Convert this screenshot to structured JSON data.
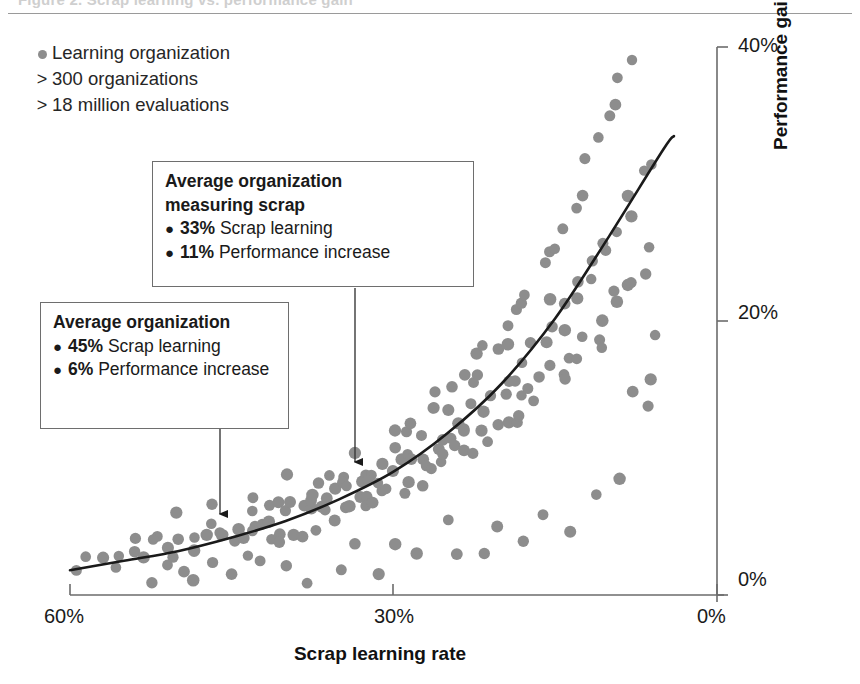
{
  "figure": {
    "clipped_header": "Figure 2. Scrap learning vs. performance gain",
    "legend": {
      "series_label": "Learning organization",
      "stat_lines": [
        {
          "prefix": ">",
          "text": "300 organizations"
        },
        {
          "prefix": ">",
          "text": "18 million evaluations"
        }
      ],
      "marker_color": "#8d8d8d"
    },
    "callouts": [
      {
        "id": "callout-measuring",
        "title": "Average organization\nmeasuring scrap",
        "items": [
          {
            "value": "33%",
            "text": " Scrap learning"
          },
          {
            "value": "11%",
            "text": " Performance increase"
          }
        ]
      },
      {
        "id": "callout-average",
        "title": "Average organization",
        "items": [
          {
            "value": "45%",
            "text": " Scrap learning"
          },
          {
            "value": "6%",
            "text": " Performance increase"
          }
        ]
      }
    ]
  },
  "chart_data": {
    "type": "scatter",
    "title": "",
    "xlabel": "Scrap learning rate",
    "ylabel": "Performance gain due to learning",
    "xlim": [
      60,
      0
    ],
    "ylim": [
      0,
      40
    ],
    "x_axis_reversed": true,
    "grid": false,
    "legend_position": "top-left",
    "x_ticks": [
      "60%",
      "30%",
      "0%"
    ],
    "x_tick_values": [
      60,
      30,
      0
    ],
    "y_ticks": [
      "0%",
      "20%",
      "40%"
    ],
    "y_tick_values": [
      0,
      20,
      40
    ],
    "point_color": "#8d8d8d",
    "trend_color": "#1a1a1a",
    "trend_label": "Fitted exponential trend",
    "annotations": [
      {
        "label": "Average organization",
        "x": 45,
        "y": 6
      },
      {
        "label": "Average organization measuring scrap",
        "x": 33,
        "y": 11
      }
    ],
    "series": [
      {
        "name": "Learning organization",
        "points": [
          [
            59.4,
            1.6
          ],
          [
            58.0,
            2.0
          ],
          [
            57.2,
            2.3
          ],
          [
            56.1,
            2.0
          ],
          [
            55.0,
            3.1
          ],
          [
            54.4,
            2.6
          ],
          [
            53.6,
            3.4
          ],
          [
            52.8,
            2.9
          ],
          [
            52.0,
            3.6
          ],
          [
            51.3,
            2.2
          ],
          [
            50.7,
            3.9
          ],
          [
            50.0,
            3.2
          ],
          [
            49.4,
            4.4
          ],
          [
            48.8,
            2.8
          ],
          [
            48.1,
            3.6
          ],
          [
            47.5,
            4.1
          ],
          [
            47.0,
            3.0
          ],
          [
            46.4,
            4.6
          ],
          [
            45.9,
            3.7
          ],
          [
            45.3,
            5.0
          ],
          [
            44.8,
            4.2
          ],
          [
            44.3,
            3.4
          ],
          [
            43.9,
            5.2
          ],
          [
            43.4,
            4.5
          ],
          [
            43.0,
            3.9
          ],
          [
            42.6,
            5.6
          ],
          [
            42.1,
            4.8
          ],
          [
            41.7,
            4.1
          ],
          [
            41.3,
            6.0
          ],
          [
            40.9,
            5.1
          ],
          [
            40.5,
            4.4
          ],
          [
            40.1,
            6.3
          ],
          [
            39.7,
            5.5
          ],
          [
            39.4,
            4.7
          ],
          [
            39.0,
            6.6
          ],
          [
            38.7,
            5.8
          ],
          [
            38.3,
            5.0
          ],
          [
            38.0,
            7.0
          ],
          [
            37.6,
            6.1
          ],
          [
            37.3,
            5.3
          ],
          [
            37.0,
            7.4
          ],
          [
            36.7,
            6.4
          ],
          [
            36.3,
            5.6
          ],
          [
            36.0,
            7.8
          ],
          [
            35.7,
            6.8
          ],
          [
            35.4,
            5.9
          ],
          [
            35.1,
            8.2
          ],
          [
            34.8,
            7.1
          ],
          [
            34.5,
            6.2
          ],
          [
            34.2,
            8.6
          ],
          [
            33.9,
            7.4
          ],
          [
            33.6,
            6.5
          ],
          [
            33.3,
            9.0
          ],
          [
            33.0,
            7.8
          ],
          [
            32.7,
            6.8
          ],
          [
            32.4,
            9.4
          ],
          [
            32.1,
            8.1
          ],
          [
            31.8,
            7.1
          ],
          [
            31.6,
            9.8
          ],
          [
            31.3,
            8.5
          ],
          [
            31.0,
            7.4
          ],
          [
            30.7,
            10.3
          ],
          [
            30.4,
            8.8
          ],
          [
            30.2,
            7.7
          ],
          [
            29.9,
            10.8
          ],
          [
            29.6,
            9.2
          ],
          [
            29.3,
            8.0
          ],
          [
            29.1,
            11.3
          ],
          [
            28.8,
            9.6
          ],
          [
            28.5,
            8.4
          ],
          [
            28.3,
            11.8
          ],
          [
            28.0,
            10.0
          ],
          [
            27.7,
            8.7
          ],
          [
            27.5,
            12.4
          ],
          [
            27.2,
            10.4
          ],
          [
            26.9,
            9.0
          ],
          [
            26.7,
            13.0
          ],
          [
            26.4,
            10.9
          ],
          [
            26.1,
            9.4
          ],
          [
            25.9,
            13.6
          ],
          [
            25.6,
            11.3
          ],
          [
            25.4,
            9.8
          ],
          [
            25.1,
            14.2
          ],
          [
            24.8,
            11.8
          ],
          [
            24.6,
            10.2
          ],
          [
            24.3,
            14.9
          ],
          [
            24.0,
            12.3
          ],
          [
            23.8,
            10.6
          ],
          [
            23.5,
            15.6
          ],
          [
            23.3,
            12.8
          ],
          [
            23.0,
            11.0
          ],
          [
            22.7,
            16.3
          ],
          [
            22.5,
            13.3
          ],
          [
            22.2,
            11.4
          ],
          [
            22.0,
            17.1
          ],
          [
            21.7,
            13.9
          ],
          [
            21.4,
            11.9
          ],
          [
            21.2,
            17.9
          ],
          [
            20.9,
            14.5
          ],
          [
            20.7,
            12.3
          ],
          [
            20.4,
            18.7
          ],
          [
            20.1,
            15.1
          ],
          [
            19.9,
            12.8
          ],
          [
            19.6,
            19.6
          ],
          [
            19.4,
            15.7
          ],
          [
            19.1,
            13.3
          ],
          [
            18.8,
            20.5
          ],
          [
            18.6,
            16.4
          ],
          [
            18.3,
            13.8
          ],
          [
            18.1,
            21.5
          ],
          [
            17.8,
            17.1
          ],
          [
            17.5,
            14.3
          ],
          [
            17.3,
            22.5
          ],
          [
            17.0,
            17.8
          ],
          [
            16.8,
            14.9
          ],
          [
            16.5,
            23.6
          ],
          [
            16.2,
            18.5
          ],
          [
            16.0,
            15.4
          ],
          [
            15.7,
            24.7
          ],
          [
            15.5,
            19.3
          ],
          [
            15.2,
            16.0
          ],
          [
            14.9,
            25.9
          ],
          [
            14.7,
            20.1
          ],
          [
            14.4,
            16.6
          ],
          [
            14.2,
            27.1
          ],
          [
            13.9,
            20.9
          ],
          [
            13.6,
            17.2
          ],
          [
            13.4,
            28.4
          ],
          [
            13.1,
            21.8
          ],
          [
            12.9,
            17.9
          ],
          [
            12.6,
            29.8
          ],
          [
            12.3,
            22.7
          ],
          [
            12.1,
            18.5
          ],
          [
            11.8,
            31.2
          ],
          [
            11.6,
            23.6
          ],
          [
            11.3,
            19.2
          ],
          [
            11.0,
            32.7
          ],
          [
            10.8,
            24.6
          ],
          [
            10.5,
            19.9
          ],
          [
            10.3,
            34.3
          ],
          [
            10.0,
            25.6
          ],
          [
            9.7,
            20.7
          ],
          [
            9.5,
            35.9
          ],
          [
            9.2,
            26.7
          ],
          [
            9.0,
            21.4
          ],
          [
            8.7,
            37.6
          ],
          [
            8.4,
            27.8
          ],
          [
            8.2,
            22.2
          ],
          [
            7.9,
            39.4
          ],
          [
            7.7,
            29.0
          ],
          [
            7.4,
            23.0
          ],
          [
            7.1,
            30.2
          ],
          [
            6.9,
            23.9
          ],
          [
            6.6,
            31.5
          ],
          [
            6.4,
            24.8
          ],
          [
            6.1,
            19.5
          ],
          [
            5.8,
            13.0
          ],
          [
            48.5,
            1.5
          ],
          [
            45.0,
            1.4
          ],
          [
            42.0,
            1.8
          ],
          [
            38.5,
            1.3
          ],
          [
            35.0,
            2.2
          ],
          [
            31.5,
            1.9
          ],
          [
            28.0,
            2.5
          ],
          [
            24.5,
            3.0
          ],
          [
            21.0,
            2.7
          ],
          [
            17.5,
            3.8
          ],
          [
            14.0,
            4.5
          ],
          [
            50.5,
            5.5
          ],
          [
            47.0,
            6.2
          ],
          [
            43.5,
            7.0
          ],
          [
            40.0,
            8.0
          ],
          [
            36.5,
            9.5
          ],
          [
            33.0,
            11.0
          ],
          [
            29.5,
            12.5
          ],
          [
            26.0,
            14.5
          ],
          [
            22.5,
            16.0
          ],
          [
            19.0,
            18.0
          ],
          [
            15.5,
            21.0
          ],
          [
            12.0,
            25.0
          ],
          [
            53.0,
            1.2
          ],
          [
            49.0,
            1.0
          ],
          [
            44.0,
            2.4
          ],
          [
            39.5,
            2.6
          ],
          [
            34.0,
            3.3
          ],
          [
            30.0,
            4.0
          ],
          [
            25.0,
            4.8
          ],
          [
            20.0,
            5.6
          ],
          [
            16.0,
            6.5
          ],
          [
            11.5,
            7.5
          ],
          [
            9.0,
            8.5
          ],
          [
            52.5,
            4.0
          ],
          [
            46.5,
            5.0
          ],
          [
            41.0,
            6.0
          ],
          [
            37.0,
            7.2
          ],
          [
            32.5,
            8.5
          ],
          [
            27.0,
            9.8
          ],
          [
            23.0,
            11.5
          ],
          [
            18.5,
            13.5
          ],
          [
            13.5,
            15.5
          ],
          [
            10.5,
            17.5
          ],
          [
            8.0,
            15.0
          ],
          [
            6.0,
            16.5
          ]
        ]
      }
    ],
    "trend_curve": {
      "description": "Exponential fit rising from ~2% at 60% scrap learning to ~33% at 4% scrap learning",
      "points": [
        [
          60,
          1.8
        ],
        [
          55,
          2.5
        ],
        [
          50,
          3.2
        ],
        [
          45,
          4.2
        ],
        [
          40,
          5.4
        ],
        [
          35,
          7.0
        ],
        [
          30,
          9.0
        ],
        [
          25,
          11.8
        ],
        [
          20,
          15.4
        ],
        [
          15,
          20.2
        ],
        [
          10,
          26.2
        ],
        [
          5,
          32.5
        ],
        [
          4,
          33.5
        ]
      ]
    }
  }
}
